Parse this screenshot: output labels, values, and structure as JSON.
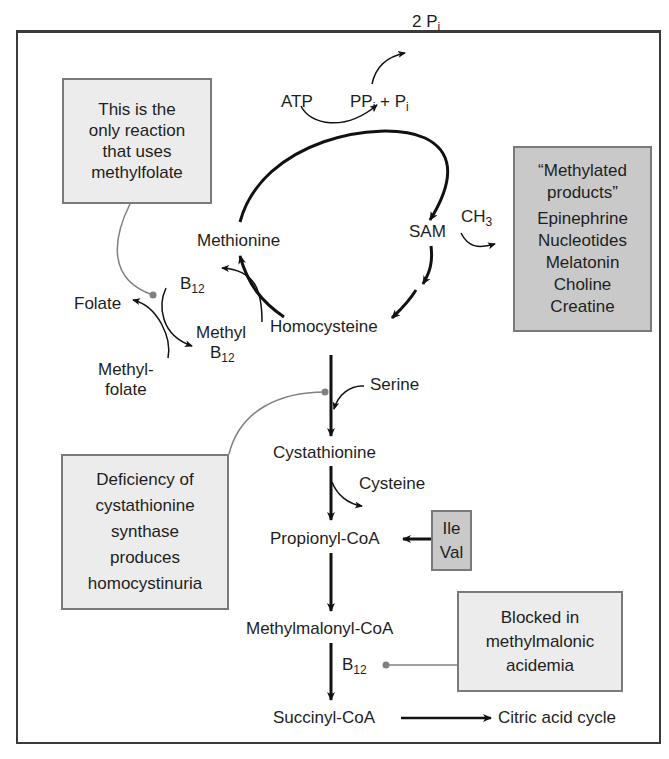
{
  "diagram": {
    "type": "metabolic-pathway",
    "cycle": {
      "atp": "ATP",
      "ppi": "PP",
      "ppi_sub": "i",
      "plus": "+",
      "pi": "P",
      "pi_sub": "i",
      "two_pi": "2 P",
      "two_pi_sub": "i",
      "methionine": "Methionine",
      "sam": "SAM",
      "ch3": "CH",
      "ch3_sub": "3",
      "homocysteine": "Homocysteine"
    },
    "folate": {
      "b12": "B",
      "b12_sub": "12",
      "folate": "Folate",
      "methyl_b12_line1": "Methyl",
      "methyl_b12_line2": "B",
      "methyl_b12_sub": "12",
      "methylfolate_line1": "Methyl-",
      "methylfolate_line2": "folate"
    },
    "transsulfuration": {
      "serine": "Serine",
      "cystathionine": "Cystathionine",
      "cysteine": "Cysteine",
      "propionyl_coa": "Propionyl-CoA",
      "methylmalonyl_coa": "Methylmalonyl-CoA",
      "b12": "B",
      "b12_sub": "12",
      "succinyl_coa": "Succinyl-CoA",
      "citric_acid_cycle": "Citric acid cycle"
    },
    "notes": {
      "methylfolate_note": [
        "This is the",
        "only reaction",
        "that uses",
        "methylfolate"
      ],
      "methylated_products": [
        "“Methylated",
        "products”",
        "Epinephrine",
        "Nucleotides",
        "Melatonin",
        "Choline",
        "Creatine"
      ],
      "ile_val": [
        "Ile",
        "Val"
      ],
      "homocystinuria_note": [
        "Deficiency of",
        "cystathionine",
        "synthase",
        "produces",
        "homocystinuria"
      ],
      "methylmalonic_note": [
        "Blocked in",
        "methylmalonic",
        "acidemia"
      ]
    },
    "colors": {
      "note_box_fill": "#ececec",
      "dark_box_fill": "#c9c9c9",
      "box_border": "#7a7a7a",
      "arrow": "#111111",
      "pointer_line": "#808080"
    }
  }
}
